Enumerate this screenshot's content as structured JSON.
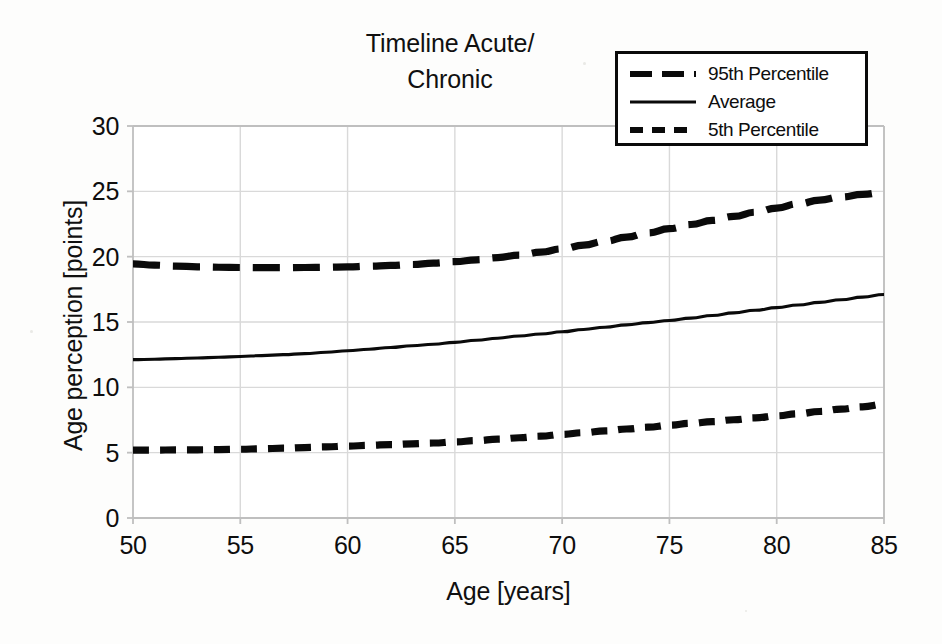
{
  "chart_data": {
    "type": "line",
    "title": "Timeline Acute/\nChronic",
    "xlabel": "Age [years]",
    "ylabel": "Age perception [points]",
    "xlim": [
      50,
      85
    ],
    "ylim": [
      0,
      30
    ],
    "xticks": [
      "50",
      "55",
      "60",
      "65",
      "70",
      "75",
      "80",
      "85"
    ],
    "yticks": [
      "0",
      "5",
      "10",
      "15",
      "20",
      "25",
      "30"
    ],
    "grid": true,
    "legend_position": "top-right",
    "x": [
      50,
      51,
      52,
      53,
      54,
      55,
      56,
      57,
      58,
      59,
      60,
      61,
      62,
      63,
      64,
      65,
      66,
      67,
      68,
      69,
      70,
      71,
      72,
      73,
      74,
      75,
      76,
      77,
      78,
      79,
      80,
      81,
      82,
      83,
      84,
      85
    ],
    "series": [
      {
        "name": "95th Percentile",
        "style": "long-dash",
        "color": "#0a0a0a",
        "values": [
          19.45,
          19.35,
          19.28,
          19.22,
          19.19,
          19.17,
          19.16,
          19.16,
          19.17,
          19.19,
          19.22,
          19.27,
          19.33,
          19.4,
          19.5,
          19.62,
          19.76,
          19.93,
          20.12,
          20.34,
          20.6,
          20.88,
          21.18,
          21.5,
          21.82,
          22.14,
          22.46,
          22.77,
          23.08,
          23.4,
          23.72,
          24.04,
          24.33,
          24.57,
          24.77,
          24.92
        ]
      },
      {
        "name": "Average",
        "style": "solid",
        "color": "#0a0a0a",
        "values": [
          12.12,
          12.15,
          12.2,
          12.25,
          12.3,
          12.36,
          12.43,
          12.5,
          12.58,
          12.68,
          12.8,
          12.92,
          13.05,
          13.18,
          13.3,
          13.44,
          13.6,
          13.76,
          13.93,
          14.08,
          14.25,
          14.43,
          14.6,
          14.78,
          14.95,
          15.12,
          15.3,
          15.5,
          15.7,
          15.9,
          16.1,
          16.3,
          16.5,
          16.7,
          16.9,
          17.1
        ]
      },
      {
        "name": "5th Percentile",
        "style": "short-dash",
        "color": "#0a0a0a",
        "values": [
          5.2,
          5.2,
          5.21,
          5.22,
          5.24,
          5.26,
          5.3,
          5.34,
          5.39,
          5.44,
          5.5,
          5.56,
          5.62,
          5.68,
          5.74,
          5.82,
          5.92,
          6.03,
          6.14,
          6.26,
          6.4,
          6.53,
          6.67,
          6.81,
          6.95,
          7.1,
          7.24,
          7.38,
          7.52,
          7.66,
          7.82,
          7.98,
          8.15,
          8.33,
          8.51,
          8.7
        ]
      }
    ]
  },
  "legend": {
    "items": [
      {
        "label": "95th Percentile",
        "style": "long-dash"
      },
      {
        "label": "Average",
        "style": "solid"
      },
      {
        "label": "5th Percentile",
        "style": "short-dash"
      }
    ]
  },
  "colors": {
    "line": "#0a0a0a",
    "grid": "#d9d9d9",
    "axis": "#bfbfbf",
    "text": "#101010",
    "plot_background": "#ffffff",
    "figure_background": "#fdfdfc",
    "legend_border": "#0a0a0a"
  }
}
